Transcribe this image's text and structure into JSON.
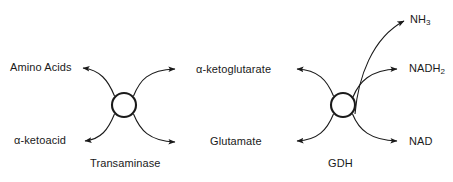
{
  "diagram": {
    "background_color": "#ffffff",
    "stroke_color": "#1a1a1a",
    "text_color": "#1a1a1a",
    "reactions": [
      {
        "id": "transaminase",
        "enzyme_label": "Transaminase",
        "node": {
          "cx": 124,
          "cy": 105,
          "r": 12
        },
        "substrates": [
          {
            "id": "amino-acids",
            "label": "Amino Acids",
            "side": "left",
            "position": "top"
          },
          {
            "id": "ketoacid",
            "label": "α-ketoacid",
            "side": "left",
            "position": "bottom"
          }
        ],
        "products": [
          {
            "id": "ketoglutarate",
            "label": "α-ketoglutarate",
            "side": "right",
            "position": "top"
          },
          {
            "id": "glutamate",
            "label": "Glutamate",
            "side": "right",
            "position": "bottom"
          }
        ]
      },
      {
        "id": "gdh",
        "enzyme_label": "GDH",
        "node": {
          "cx": 343,
          "cy": 105,
          "r": 12
        },
        "substrates": [
          {
            "id": "gdh-in-top",
            "label": "",
            "side": "left",
            "position": "top"
          },
          {
            "id": "gdh-in-bottom",
            "label": "",
            "side": "left",
            "position": "bottom"
          }
        ],
        "products": [
          {
            "id": "nh3",
            "label_html": "NH<sub>3</sub>",
            "label": "NH3",
            "base": "NH",
            "sub": "3",
            "side": "right",
            "position": "far-top"
          },
          {
            "id": "nadh2",
            "label_html": "NADH<sub>2</sub>",
            "label": "NADH2",
            "base": "NADH",
            "sub": "2",
            "side": "right",
            "position": "top"
          },
          {
            "id": "nad",
            "label": "NAD",
            "base": "NAD",
            "sub": "",
            "side": "right",
            "position": "bottom"
          }
        ]
      }
    ]
  }
}
